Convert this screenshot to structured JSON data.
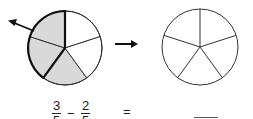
{
  "diagram": {
    "left_circle": {
      "parts": 5,
      "shaded_parts": 3,
      "removed_parts": 2,
      "shade_color": "#d9d9d9",
      "outline_color": "#222222"
    },
    "transition_arrow": "→",
    "right_circle": {
      "parts": 5,
      "shaded_parts": 0
    }
  },
  "equation": {
    "fraction1": {
      "numerator": "3",
      "denominator": "5"
    },
    "operator": "−",
    "fraction2": {
      "numerator": "2",
      "denominator": "5"
    },
    "equals": "=",
    "answer": ""
  }
}
